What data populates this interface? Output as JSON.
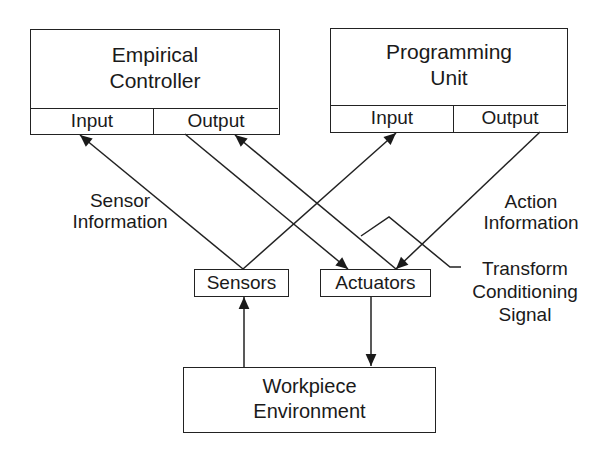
{
  "diagram": {
    "nodes": {
      "empirical_controller": {
        "title_line1": "Empirical",
        "title_line2": "Controller",
        "input_label": "Input",
        "output_label": "Output"
      },
      "programming_unit": {
        "title_line1": "Programming",
        "title_line2": "Unit",
        "input_label": "Input",
        "output_label": "Output"
      },
      "sensors": {
        "label": "Sensors"
      },
      "actuators": {
        "label": "Actuators"
      },
      "workpiece_environment": {
        "title_line1": "Workpiece",
        "title_line2": "Environment"
      }
    },
    "annotations": {
      "sensor_information": {
        "line1": "Sensor",
        "line2": "Information"
      },
      "action_information": {
        "line1": "Action",
        "line2": "Information"
      },
      "transform_signal": {
        "line1": "Transform",
        "line2": "Conditioning",
        "line3": "Signal"
      }
    },
    "edges": [
      {
        "from": "sensors",
        "to": "empirical_controller.input",
        "label": "Sensor Information"
      },
      {
        "from": "sensors",
        "to": "programming_unit.input"
      },
      {
        "from": "empirical_controller.output",
        "to": "actuators"
      },
      {
        "from": "programming_unit.output",
        "to": "actuators",
        "label": "Action Information"
      },
      {
        "from": "actuators",
        "to": "empirical_controller.output",
        "label": "Transform Conditioning Signal"
      },
      {
        "from": "workpiece_environment",
        "to": "sensors"
      },
      {
        "from": "actuators",
        "to": "workpiece_environment"
      }
    ],
    "colors": {
      "line": "#222222",
      "background": "#ffffff"
    }
  }
}
